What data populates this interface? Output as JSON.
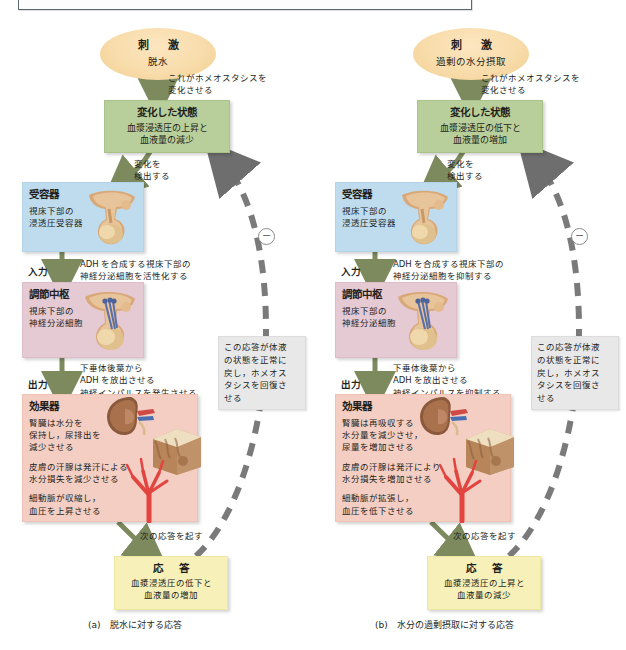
{
  "figure": {
    "panels": [
      {
        "id": "a",
        "caption": "(a)　脱水に対する応答",
        "stimulus": {
          "title": "刺　激",
          "sub": "脱水"
        },
        "arrow_stimulus_label": "これがホメオスタシスを\n変化させる",
        "arrow_stimulus_label_l1": "これがホメオスタシスを",
        "arrow_stimulus_label_l2": "変化させる",
        "state": {
          "title": "変化した状態",
          "line1": "血漿浸透圧の上昇と",
          "line2": "血液量の減少"
        },
        "detect_label_l1": "変化を",
        "detect_label_l2": "検出する",
        "receptor": {
          "title": "受容器",
          "line1": "視床下部の",
          "line2": "浸透圧受容器",
          "icon": "hypothalamus-pituitary-illustration"
        },
        "input_label": "入力",
        "input_text_l1": "ADH を合成する視床下部の",
        "input_text_l2": "神経分泌細胞を活性化する",
        "control": {
          "title": "調節中枢",
          "line1": "視床下部の",
          "line2": "神経分泌細胞",
          "icon": "hypothalamus-neurosecretory-cells-illustration"
        },
        "output_label": "出力",
        "output_text_l1": "下垂体後葉から",
        "output_text_l2": "ADH を放出させる",
        "output_text_l3": "神経インパルスを発生させる",
        "effector": {
          "title": "効果器",
          "block1_l1": "腎臓は水分を",
          "block1_l2": "保持し，尿排出を",
          "block1_l3": "減少させる",
          "block2_l1": "皮膚の汗腺は発汗による",
          "block2_l2": "水分損失を減少させる",
          "block3_l1": "細動脈が収縮し，",
          "block3_l2": "血圧を上昇させる",
          "icon_kidney": "kidney-illustration",
          "icon_skin": "skin-block-illustration",
          "icon_arteriole": "arteriole-illustration"
        },
        "next_response_label": "次の応答を起す",
        "response": {
          "title": "応　答",
          "line1": "血漿浸透圧の低下と",
          "line2": "血液量の増加"
        },
        "sidenote_l1": "この応答が体液",
        "sidenote_l2": "の状態を正常に",
        "sidenote_l3": "戻し，ホメオス",
        "sidenote_l4": "タシスを回復さ",
        "sidenote_l5": "せる",
        "feedback_sign": "−"
      },
      {
        "id": "b",
        "caption": "(b)　水分の過剰摂取に対する応答",
        "stimulus": {
          "title": "刺　激",
          "sub": "過剰の水分摂取"
        },
        "arrow_stimulus_label_l1": "これがホメオスタシスを",
        "arrow_stimulus_label_l2": "変化させる",
        "state": {
          "title": "変化した状態",
          "line1": "血漿浸透圧の低下と",
          "line2": "血液量の増加"
        },
        "detect_label_l1": "変化を",
        "detect_label_l2": "検出する",
        "receptor": {
          "title": "受容器",
          "line1": "視床下部の",
          "line2": "浸透圧受容器",
          "icon": "hypothalamus-pituitary-illustration"
        },
        "input_label": "入力",
        "input_text_l1": "ADH を合成する視床下部の",
        "input_text_l2": "神経分泌細胞を抑制する",
        "control": {
          "title": "調節中枢",
          "line1": "視床下部の",
          "line2": "神経分泌細胞",
          "icon": "hypothalamus-neurosecretory-cells-illustration"
        },
        "output_label": "出力",
        "output_text_l1": "下垂体後葉から",
        "output_text_l2": "ADH を放出させる",
        "output_text_l3": "神経インパルスを抑制する",
        "effector": {
          "title": "効果器",
          "block1_l1": "腎臓は再吸収する",
          "block1_l2": "水分量を減少させ，",
          "block1_l3": "尿量を増加させる",
          "block2_l1": "皮膚の汗腺は発汗により",
          "block2_l2": "水分損失を増加させる",
          "block3_l1": "細動脈が拡張し，",
          "block3_l2": "血圧を低下させる",
          "icon_kidney": "kidney-illustration",
          "icon_skin": "skin-block-illustration",
          "icon_arteriole": "arteriole-illustration"
        },
        "next_response_label": "次の応答を起す",
        "response": {
          "title": "応　答",
          "line1": "血漿浸透圧の上昇と",
          "line2": "血液量の減少"
        },
        "sidenote_l1": "この応答が体液",
        "sidenote_l2": "の状態を正常に",
        "sidenote_l3": "戻し，ホメオス",
        "sidenote_l4": "タシスを回復さ",
        "sidenote_l5": "せる",
        "feedback_sign": "−"
      }
    ],
    "colors": {
      "stimulus": "#f8dcab",
      "state": "#b9cf9b",
      "receptor": "#bfdcee",
      "control": "#e5c9d3",
      "effector": "#f4cec3",
      "response": "#f7f0b8",
      "arrow": "#7d8a5e",
      "feedback_dash": "#7a7a7a"
    }
  }
}
